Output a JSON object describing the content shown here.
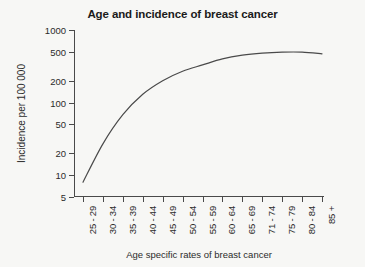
{
  "chart_data": {
    "type": "line",
    "title": "Age and incidence of breast cancer",
    "xlabel": "Age specific rates of breast cancer",
    "ylabel": "Incidence per 100 000",
    "yscale": "log",
    "ylim": [
      5,
      1000
    ],
    "yticks": [
      1000,
      500,
      200,
      100,
      50,
      20,
      10,
      5
    ],
    "ytick_labels": [
      "1000",
      "500",
      "200",
      "100",
      "50",
      "20",
      "10",
      "5"
    ],
    "grid": false,
    "legend": "none",
    "categories": [
      "25 - 29",
      "30 - 34",
      "35 - 39",
      "40 - 44",
      "45 - 49",
      "50 - 54",
      "55 - 59",
      "60 - 64",
      "65 - 69",
      "71 - 74",
      "75 - 79",
      "80 - 84",
      "85 +"
    ],
    "values": [
      8,
      27,
      68,
      130,
      200,
      270,
      330,
      400,
      450,
      480,
      495,
      495,
      470
    ],
    "series": [
      {
        "name": "Incidence per 100 000",
        "values": [
          8,
          27,
          68,
          130,
          200,
          270,
          330,
          400,
          450,
          480,
          495,
          495,
          470
        ]
      }
    ],
    "line_color": "#4a4a4a"
  },
  "colors": {
    "background": "#f7f7f5",
    "axis": "#4a4a4a",
    "text": "#2b2b2b",
    "curve": "#4a4a4a"
  }
}
